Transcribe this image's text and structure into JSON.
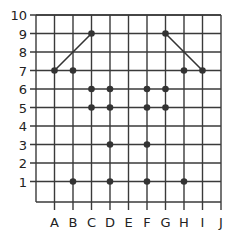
{
  "grid": {
    "x_labels": [
      "A",
      "B",
      "C",
      "D",
      "E",
      "F",
      "G",
      "H",
      "I",
      "J"
    ],
    "y_labels": [
      "1",
      "2",
      "3",
      "4",
      "5",
      "6",
      "7",
      "8",
      "9",
      "10"
    ],
    "line_color": "#3a3a3a",
    "point_color": "#333333"
  },
  "points": [
    {
      "x": "A",
      "y": 7
    },
    {
      "x": "B",
      "y": 7
    },
    {
      "x": "C",
      "y": 9
    },
    {
      "x": "C",
      "y": 6
    },
    {
      "x": "C",
      "y": 5
    },
    {
      "x": "D",
      "y": 6
    },
    {
      "x": "D",
      "y": 5
    },
    {
      "x": "D",
      "y": 3
    },
    {
      "x": "D",
      "y": 1
    },
    {
      "x": "B",
      "y": 1
    },
    {
      "x": "F",
      "y": 6
    },
    {
      "x": "F",
      "y": 5
    },
    {
      "x": "F",
      "y": 3
    },
    {
      "x": "F",
      "y": 1
    },
    {
      "x": "G",
      "y": 9
    },
    {
      "x": "G",
      "y": 6
    },
    {
      "x": "G",
      "y": 5
    },
    {
      "x": "H",
      "y": 7
    },
    {
      "x": "I",
      "y": 7
    },
    {
      "x": "H",
      "y": 1
    }
  ],
  "segments": [
    {
      "from": {
        "x": "A",
        "y": 7
      },
      "to": {
        "x": "C",
        "y": 9
      }
    },
    {
      "from": {
        "x": "G",
        "y": 9
      },
      "to": {
        "x": "I",
        "y": 7
      }
    }
  ]
}
